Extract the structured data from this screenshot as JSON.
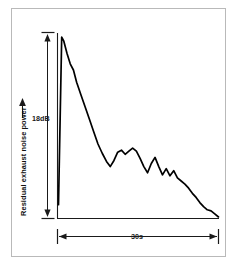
{
  "chart_data": {
    "type": "line",
    "title": "",
    "subtitle": "",
    "xlabel": "",
    "ylabel": "Residual exhaust noise power",
    "y_scale_annotation": "18dB",
    "x_scale_annotation": "30s",
    "grid": false,
    "legend": null,
    "axis_style": "two-axis-arrow-scale-bars",
    "x_units": "seconds",
    "y_units": "dB",
    "xlim": [
      0,
      30
    ],
    "ylim": [
      0,
      18
    ],
    "x": [
      0.0,
      0.6,
      1.0,
      1.6,
      2.2,
      2.8,
      3.4,
      4.2,
      5.0,
      5.8,
      6.6,
      7.4,
      8.2,
      9.0,
      9.7,
      10.4,
      11.1,
      11.8,
      12.5,
      13.2,
      13.9,
      14.6,
      15.3,
      16.0,
      16.7,
      17.4,
      18.1,
      18.8,
      19.5,
      20.2,
      20.9,
      21.6,
      22.3,
      23.0,
      23.7,
      24.4,
      25.1,
      25.8,
      26.5,
      27.2,
      27.9,
      28.6,
      29.3,
      30.0
    ],
    "y": [
      1.3,
      17.6,
      17.2,
      16.0,
      15.0,
      14.4,
      13.2,
      12.0,
      10.8,
      9.6,
      8.4,
      7.2,
      6.3,
      5.5,
      5.0,
      5.6,
      6.4,
      6.6,
      6.2,
      6.5,
      6.8,
      6.5,
      5.8,
      5.0,
      4.4,
      5.3,
      5.9,
      5.0,
      4.2,
      4.8,
      4.1,
      4.6,
      3.9,
      3.6,
      3.3,
      2.9,
      2.4,
      2.0,
      1.5,
      1.1,
      0.8,
      0.7,
      0.4,
      0.1
    ],
    "series": [
      {
        "name": "Residual exhaust noise power",
        "color": "#000000",
        "style": "solid"
      }
    ]
  },
  "annotations": {
    "y_scale_label": "18dB",
    "x_scale_label": "30s",
    "y_axis_title": "Residual exhaust noise power"
  },
  "colors": {
    "curve": "#000000",
    "axis": "#1a1a1a",
    "frame": "#b9b9b9",
    "background": "#ffffff"
  }
}
